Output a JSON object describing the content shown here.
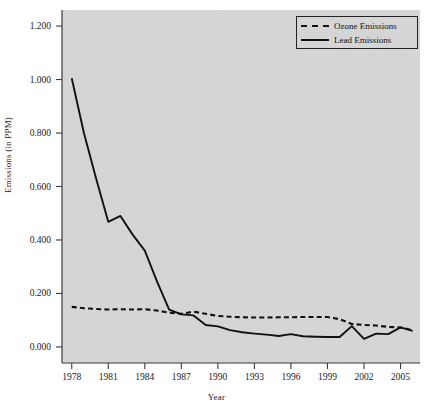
{
  "chart_data": {
    "type": "line",
    "title": "",
    "xlabel": "Year",
    "ylabel": "Emissions (in PPM)",
    "xlim": [
      1977.2,
      2006.6
    ],
    "ylim": [
      -0.06,
      1.26
    ],
    "grid": false,
    "legend_position": "top-right",
    "y_ticks": [
      "0.000",
      "0.200",
      "0.400",
      "0.600",
      "0.800",
      "1.000",
      "1.200"
    ],
    "y_tick_values": [
      0.0,
      0.2,
      0.4,
      0.6,
      0.8,
      1.0,
      1.2
    ],
    "x_ticks": [
      "1978",
      "1981",
      "1984",
      "1987",
      "1990",
      "1993",
      "1996",
      "1999",
      "2002",
      "2005"
    ],
    "x_tick_values": [
      1978,
      1981,
      1984,
      1987,
      1990,
      1993,
      1996,
      1999,
      2002,
      2005
    ],
    "x": [
      1978,
      1979,
      1980,
      1981,
      1982,
      1983,
      1984,
      1985,
      1986,
      1987,
      1988,
      1989,
      1990,
      1991,
      1992,
      1993,
      1994,
      1995,
      1996,
      1997,
      1998,
      1999,
      2000,
      2001,
      2002,
      2003,
      2004,
      2005,
      2006
    ],
    "series": [
      {
        "name": "Ozone Emissions",
        "style": "dashed",
        "color": "#111111",
        "values": [
          0.15,
          0.145,
          0.142,
          0.14,
          0.141,
          0.14,
          0.141,
          0.136,
          0.128,
          0.124,
          0.132,
          0.124,
          0.116,
          0.113,
          0.111,
          0.11,
          0.11,
          0.111,
          0.111,
          0.112,
          0.112,
          0.112,
          0.104,
          0.086,
          0.082,
          0.08,
          0.075,
          0.073,
          0.062
        ]
      },
      {
        "name": "Lead Emissions",
        "style": "solid",
        "color": "#111111",
        "values": [
          1.005,
          0.8,
          0.63,
          0.468,
          0.49,
          0.42,
          0.36,
          0.245,
          0.14,
          0.122,
          0.118,
          0.082,
          0.077,
          0.063,
          0.055,
          0.05,
          0.046,
          0.041,
          0.048,
          0.04,
          0.038,
          0.037,
          0.037,
          0.078,
          0.03,
          0.05,
          0.048,
          0.073,
          0.06
        ]
      }
    ]
  },
  "legend": {
    "entries": [
      {
        "label": "Ozone Emissions"
      },
      {
        "label": "Lead Emissions"
      }
    ]
  },
  "style": {
    "plot_background": "#d6d6d6",
    "line_color": "#111111",
    "axis_color": "#3a3a3a",
    "page_background": "#ffffff"
  }
}
